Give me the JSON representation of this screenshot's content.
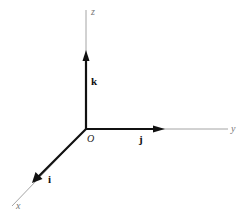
{
  "diagram": {
    "origin": {
      "label": "O",
      "x": 86,
      "y": 129
    },
    "axes": [
      {
        "name": "x",
        "label": "x",
        "end": [
          12,
          206
        ]
      },
      {
        "name": "y",
        "label": "y",
        "end": [
          228,
          129
        ]
      },
      {
        "name": "z",
        "label": "z",
        "end": [
          86,
          10
        ]
      }
    ],
    "vectors": [
      {
        "name": "i",
        "label": "i",
        "direction": "x",
        "tip": [
          32,
          183
        ]
      },
      {
        "name": "j",
        "label": "j",
        "direction": "y",
        "tip": [
          165,
          129
        ]
      },
      {
        "name": "k",
        "label": "k",
        "direction": "z",
        "tip": [
          86,
          50
        ]
      }
    ],
    "colors": {
      "axis": "#9a9a9a",
      "vector": "#111111",
      "background": "#ffffff"
    }
  }
}
